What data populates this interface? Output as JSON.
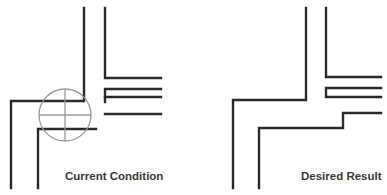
{
  "panels": [
    {
      "id": "current",
      "caption": "Current Condition",
      "marker": "circle-crosshair",
      "colors": {
        "lines": "#2a2a2a",
        "marker": "#999999"
      }
    },
    {
      "id": "desired",
      "caption": "Desired Result",
      "colors": {
        "lines": "#2a2a2a"
      }
    }
  ]
}
